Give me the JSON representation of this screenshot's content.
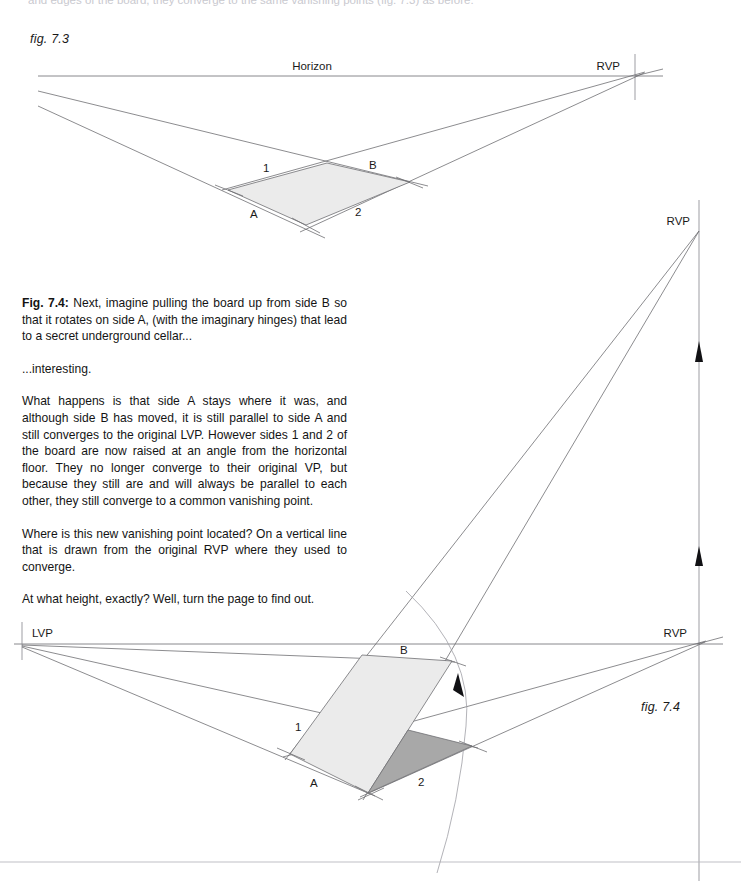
{
  "page": {
    "width": 741,
    "height": 881,
    "background": "#ffffff",
    "cut_off_top_line": "and edges of the board, they converge to the same vanishing points (fig. 7.3) as before."
  },
  "figure_73": {
    "caption": "fig. 7.3",
    "horizon_label": "Horizon",
    "rvp_label": "RVP",
    "corner_labels": {
      "side_a": "A",
      "side_b": "B",
      "side_1": "1",
      "side_2": "2"
    },
    "colors": {
      "board_fill": "#ebebeb",
      "line": "#6e6e72",
      "horizon": "#7b7b80"
    },
    "geometry": {
      "horizon_y": 76,
      "horizon_x1": 38,
      "horizon_x2": 663,
      "rvp": [
        635,
        76
      ],
      "board_quad": [
        [
          228,
          190
        ],
        [
          327,
          163
        ],
        [
          410,
          182
        ],
        [
          306,
          225
        ]
      ]
    }
  },
  "body_copy": {
    "paragraphs": [
      {
        "lead": "Fig. 7.4:",
        "text": " Next, imagine pulling the board up from side B so that it rotates on side A, (with the imaginary hinges) that lead to a secret underground cellar..."
      },
      {
        "lead": "",
        "text": "...interesting."
      },
      {
        "lead": "",
        "text": "What happens is that side A stays where it was, and although side B has moved, it is still parallel to side A and still converges to the original LVP. However sides 1 and 2 of the board are now raised at an angle from the horizontal floor. They no longer converge to their original VP, but because they still are and will always be parallel to each other, they still converge to a common vanishing point."
      },
      {
        "lead": "",
        "text": "Where is this new vanishing point located? On a vertical line that is drawn from the original RVP where they used to converge."
      },
      {
        "lead": "",
        "text": "At what height, exactly? Well, turn the page to find out."
      }
    ]
  },
  "figure_74": {
    "caption": "fig. 7.4",
    "lvp_label": "LVP",
    "rvp_lower_label": "RVP",
    "rvp_upper_label": "RVP",
    "corner_labels": {
      "side_a": "A",
      "side_b": "B",
      "side_1": "1",
      "side_2": "2"
    },
    "colors": {
      "raised_board_fill": "#ebebeb",
      "original_board_fill": "#a8a8a8",
      "line": "#6e6e72",
      "horizon": "#7b7b80",
      "vertical_guide": "#8d8d93",
      "arrow": "#111114",
      "arc": "#a0a0a6"
    },
    "geometry": {
      "horizon_y": 644,
      "horizon_x1": 14,
      "horizon_x2": 723,
      "lvp": [
        22,
        644
      ],
      "rvp_lower": [
        697,
        644
      ],
      "rvp_upper": [
        699,
        231
      ],
      "vertical_line_x": 699,
      "vertical_from_y": 644,
      "vertical_to_y": 200,
      "arrow_y_positions": [
        350,
        553
      ],
      "raised_quad": [
        [
          290,
          754
        ],
        [
          362,
          655
        ],
        [
          452,
          661
        ],
        [
          368,
          793
        ]
      ],
      "original_quad": [
        [
          368,
          793
        ],
        [
          408,
          730
        ],
        [
          472,
          746
        ]
      ],
      "bottom_border_y": 862
    }
  }
}
